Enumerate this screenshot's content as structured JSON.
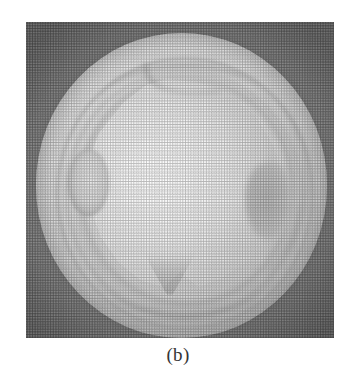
{
  "figure": {
    "caption": "(b)",
    "panel_label": "b",
    "media_type": "grayscale halftone photograph",
    "colors": {
      "page_background": "#ffffff",
      "plate_background": "#8b8b8b",
      "disc_bright": "#f2f2f2",
      "disc_rim": "#a6a6a6",
      "inner_blob": "#ffffff",
      "caption_text": "#353535"
    },
    "features": [
      {
        "name": "outer-disc",
        "label": "outer bright disc"
      },
      {
        "name": "rim-bands",
        "label": "concentric rim bands"
      },
      {
        "name": "inner-blob",
        "label": "bright inner region"
      },
      {
        "name": "top-ridge",
        "label": "ridge across top"
      },
      {
        "name": "left-lobe",
        "label": "oval lobe on left flank"
      },
      {
        "name": "right-notch",
        "label": "dark depression on right flank"
      },
      {
        "name": "bottom-notch",
        "label": "V-shaped notch at bottom"
      },
      {
        "name": "highlight",
        "label": "specular highlight"
      }
    ],
    "plate_bounds": {
      "x": 26,
      "y": 22,
      "width": 308,
      "height": 316
    }
  }
}
